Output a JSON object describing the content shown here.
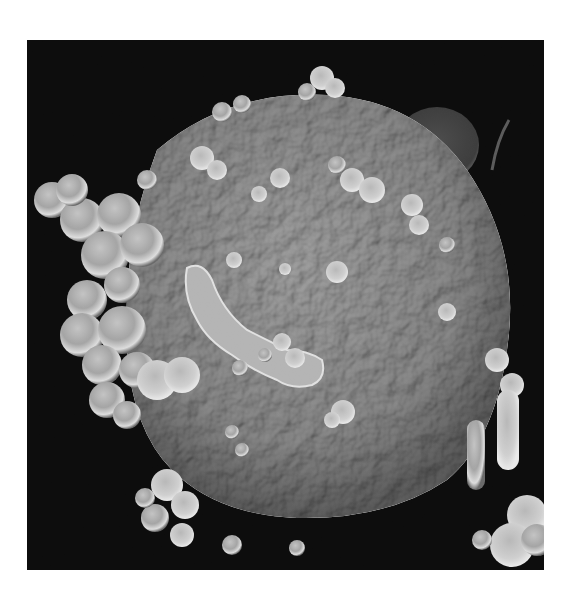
{
  "figure": {
    "kind": "scanning electron micrograph",
    "colors": {
      "page_background": "#ffffff",
      "image_background": "#050505",
      "cell_body": "#8f8f8f",
      "bleb_highlight": "#dcdcdc",
      "bleb_shadow": "#5a5a5a"
    },
    "frame": {
      "x": 27,
      "y": 40,
      "width": 517,
      "height": 530
    }
  }
}
